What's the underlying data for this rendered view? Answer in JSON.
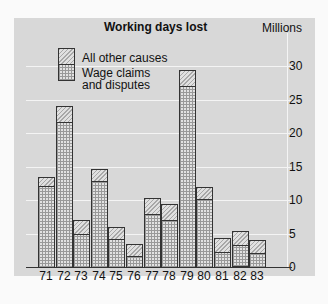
{
  "chart_data": {
    "type": "bar",
    "stacked": true,
    "title": "Working days lost",
    "ylabel": "Millions",
    "xlabel": "",
    "categories": [
      "71",
      "72",
      "73",
      "74",
      "75",
      "76",
      "77",
      "78",
      "79",
      "80",
      "81",
      "82",
      "83"
    ],
    "series": [
      {
        "name": "Wage claims and disputes",
        "values": [
          12.3,
          21.8,
          5.0,
          13.0,
          4.3,
          1.8,
          8.0,
          7.2,
          27.2,
          10.3,
          2.4,
          3.3,
          2.2
        ]
      },
      {
        "name": "All other causes",
        "values": [
          1.2,
          2.2,
          2.0,
          1.7,
          1.7,
          1.7,
          2.3,
          2.2,
          2.2,
          1.7,
          1.9,
          2.0,
          1.8
        ]
      }
    ],
    "ylim": [
      0,
      33
    ],
    "yticks": [
      0,
      5,
      10,
      15,
      20,
      25,
      30
    ],
    "grid": true,
    "legend_position": "top-left inside"
  },
  "title": "Working days lost",
  "unit": "Millions",
  "legend": {
    "other": "All other causes",
    "wage_line1": "Wage claims",
    "wage_line2": "and disputes"
  },
  "yticks": [
    "30",
    "25",
    "20",
    "15",
    "10",
    "5",
    "0"
  ]
}
